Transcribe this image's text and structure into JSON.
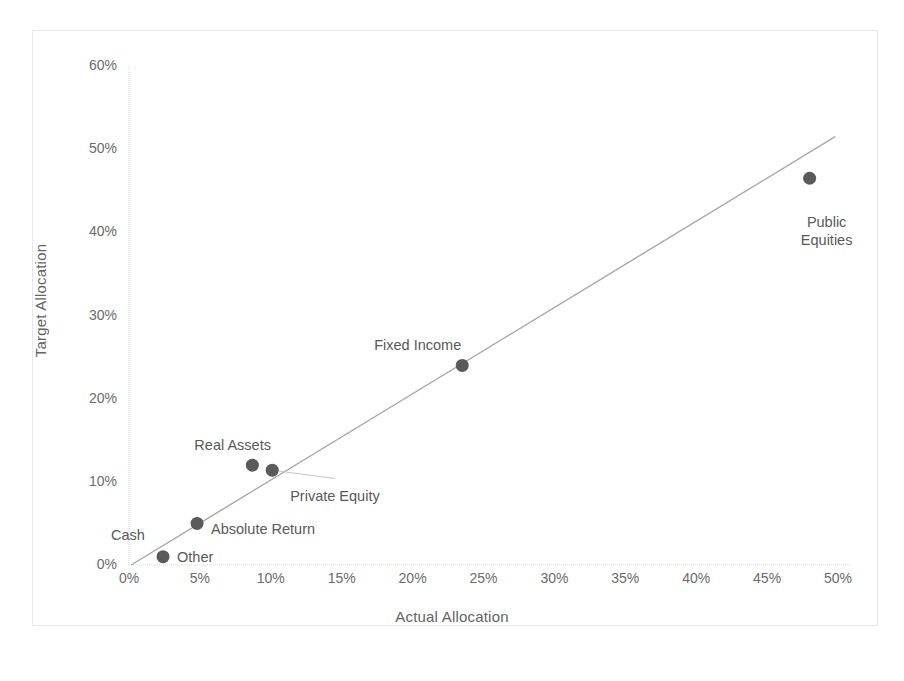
{
  "chart_data": {
    "type": "scatter",
    "title": "",
    "xlabel": "Actual Allocation",
    "ylabel": "Target Allocation",
    "xlim": [
      0,
      50
    ],
    "ylim": [
      0,
      60
    ],
    "xticks": [
      "0%",
      "5%",
      "10%",
      "15%",
      "20%",
      "25%",
      "30%",
      "35%",
      "40%",
      "45%",
      "50%"
    ],
    "yticks": [
      "0%",
      "10%",
      "20%",
      "30%",
      "40%",
      "50%",
      "60%"
    ],
    "xtick_values": [
      0,
      5,
      10,
      15,
      20,
      25,
      30,
      35,
      40,
      45,
      50
    ],
    "ytick_values": [
      0,
      10,
      20,
      30,
      40,
      50,
      60
    ],
    "grid": false,
    "legend": "none",
    "marker_color": "#5a5a5a",
    "trendline_color": "#a6a6a6",
    "axis_color": "#d9d9d9",
    "points": [
      {
        "label": "Other",
        "x": 2.4,
        "y": 1.0,
        "label_dx": 14,
        "label_dy": -8,
        "anchor": "left"
      },
      {
        "label": "Cash",
        "x": 2.4,
        "y": 1.0,
        "label_dx": -52,
        "label_dy": -30,
        "anchor": "left"
      },
      {
        "label": "Absolute Return",
        "x": 4.8,
        "y": 5.0,
        "label_dx": 14,
        "label_dy": -2,
        "anchor": "left"
      },
      {
        "label": "Real Assets",
        "x": 8.7,
        "y": 12.0,
        "label_dx": -58,
        "label_dy": -28,
        "anchor": "left"
      },
      {
        "label": "Private Equity",
        "x": 10.1,
        "y": 11.4,
        "label_dx": 18,
        "label_dy": 18,
        "anchor": "left"
      },
      {
        "label": "Fixed Income",
        "x": 23.5,
        "y": 24.0,
        "label_dx": -88,
        "label_dy": -28,
        "anchor": "left"
      },
      {
        "label": "Public Equities",
        "x": 48.0,
        "y": 46.5,
        "label_dx": -16,
        "label_dy": 36,
        "anchor": "center"
      }
    ],
    "trendline": {
      "x0": 0.15,
      "y0": 0.0,
      "x1": 49.8,
      "y1": 51.5
    },
    "leader_line": {
      "x0": 10.1,
      "y0": 11.4,
      "x1": 14.5,
      "y1": 10.4
    }
  },
  "axes": {
    "x_title": "Actual Allocation",
    "y_title": "Target Allocation"
  }
}
